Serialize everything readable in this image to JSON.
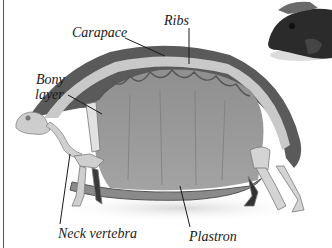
{
  "figure": {
    "labels": {
      "carapace": "Carapace",
      "ribs": "Ribs",
      "bony_layer_line1": "Bony",
      "bony_layer_line2": "layer",
      "neck_vertebra": "Neck vertebra",
      "plastron": "Plastron"
    },
    "colors": {
      "background": "#ffffff",
      "shell_dark": "#5a5a5a",
      "shell_interior": "#9a9a9a",
      "bone_light": "#cfcfcf",
      "leader_line": "#1a1a1a",
      "text": "#1a1a1a"
    }
  }
}
